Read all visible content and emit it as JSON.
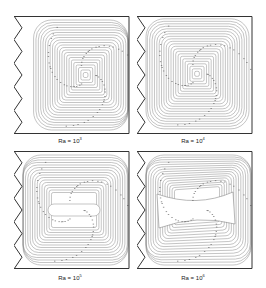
{
  "figure": {
    "panels": [
      {
        "id": "ra-1e3",
        "label_prefix": "Ra = 10",
        "exponent": "3",
        "vortex": "single-centered",
        "cx": 0.6,
        "cy": 0.5
      },
      {
        "id": "ra-1e4",
        "label_prefix": "Ra = 10",
        "exponent": "4",
        "vortex": "single-left-shifted",
        "cx": 0.5,
        "cy": 0.49
      },
      {
        "id": "ra-1e5",
        "label_prefix": "Ra = 10",
        "exponent": "5",
        "vortex": "elongated-horizontal-core",
        "cx": 0.5,
        "cy": 0.5
      },
      {
        "id": "ra-1e6",
        "label_prefix": "Ra = 10",
        "exponent": "6",
        "vortex": "bow-tie-core",
        "cx": 0.5,
        "cy": 0.5
      }
    ],
    "colors": {
      "wall": "#333333",
      "streamline": "#8a8a8a",
      "arrow": "#555555",
      "background": "#ffffff"
    },
    "geometry": {
      "left_wall": "zigzag",
      "zigzag_teeth": 5
    }
  }
}
